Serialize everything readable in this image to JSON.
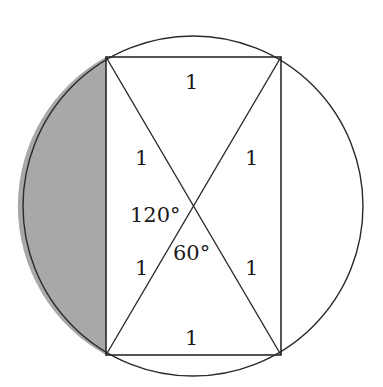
{
  "diagram": {
    "colors": {
      "stroke": "#2a2a2a",
      "shade": "#a8a8a8",
      "background": "#ffffff"
    },
    "labels": {
      "top_side": "1",
      "bottom_side": "1",
      "upper_left_half_diagonal": "1",
      "upper_right_half_diagonal": "1",
      "lower_left_half_diagonal": "1",
      "lower_right_half_diagonal": "1",
      "angle_left": "120°",
      "angle_bottom": "60°"
    }
  }
}
